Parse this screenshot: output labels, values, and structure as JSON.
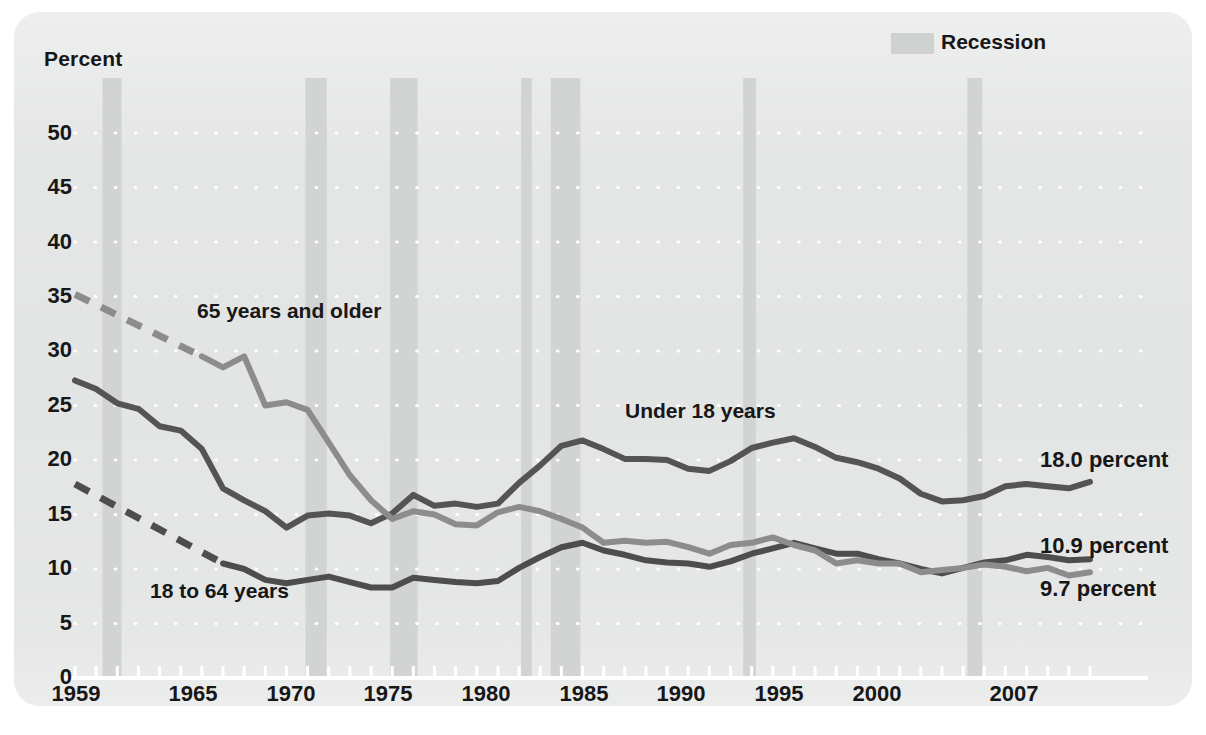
{
  "figure": {
    "panel_background": "#e3e4e4",
    "page_background": "#ffffff"
  },
  "legend": {
    "position": "top-right",
    "swatch_name": "recession-swatch",
    "label": "Recession",
    "swatch_color": "#cfd0d0"
  },
  "axes": {
    "y_title": "Percent",
    "y_ticks": [
      "0",
      "5",
      "10",
      "15",
      "20",
      "25",
      "30",
      "35",
      "40",
      "45",
      "50"
    ],
    "x_ticks": [
      "1959",
      "1965",
      "1970",
      "1975",
      "1980",
      "1985",
      "1990",
      "1995",
      "2000",
      "2007"
    ]
  },
  "series_labels": {
    "older": "65 years and older",
    "under18": "Under 18 years",
    "adults": "18 to 64 years"
  },
  "end_labels": {
    "under18": "18.0 percent",
    "older": "10.9 percent",
    "adults": "9.7 percent"
  },
  "chart_data": {
    "type": "line",
    "title": "",
    "subtitle": "",
    "xlabel": "",
    "ylabel": "Percent",
    "xlim": [
      1959,
      2007
    ],
    "ylim": [
      0,
      50
    ],
    "ytick_step": 5,
    "grid": "dotted-horizontal-white",
    "legend_position": "top-right",
    "colors": {
      "under18": "#545454",
      "adults": "#4d4d4d",
      "older": "#8c8c8c"
    },
    "annotations": [
      {
        "text": "65 years and older",
        "x": 1962.5,
        "y": 31.5
      },
      {
        "text": "Under 18 years",
        "x": 1984.0,
        "y": 25.6
      },
      {
        "text": "18 to 64 years",
        "x": 1963.0,
        "y": 7.4
      }
    ],
    "recession_bands": [
      {
        "start": 1960.3,
        "end": 1961.2
      },
      {
        "start": 1969.9,
        "end": 1970.9
      },
      {
        "start": 1973.9,
        "end": 1975.2
      },
      {
        "start": 1980.1,
        "end": 1980.6
      },
      {
        "start": 1981.5,
        "end": 1982.9
      },
      {
        "start": 1990.6,
        "end": 1991.2
      },
      {
        "start": 2001.2,
        "end": 2001.9
      }
    ],
    "x": [
      1959,
      1960,
      1961,
      1962,
      1963,
      1964,
      1965,
      1966,
      1967,
      1968,
      1969,
      1970,
      1971,
      1972,
      1973,
      1974,
      1975,
      1976,
      1977,
      1978,
      1979,
      1980,
      1981,
      1982,
      1983,
      1984,
      1985,
      1986,
      1987,
      1988,
      1989,
      1990,
      1991,
      1992,
      1993,
      1994,
      1995,
      1996,
      1997,
      1998,
      1999,
      2000,
      2001,
      2002,
      2003,
      2004,
      2005,
      2006,
      2007
    ],
    "series": [
      {
        "name": "Under 18 years",
        "dashed_prefix_through": 1959,
        "values": [
          27.3,
          26.5,
          25.2,
          24.7,
          23.1,
          22.7,
          21.0,
          17.4,
          16.3,
          15.3,
          13.8,
          14.9,
          15.1,
          14.9,
          14.2,
          15.1,
          16.8,
          15.8,
          16.0,
          15.7,
          16.0,
          17.9,
          19.5,
          21.3,
          21.8,
          21.0,
          20.1,
          20.1,
          20.0,
          19.2,
          19.0,
          19.9,
          21.1,
          21.6,
          22.0,
          21.2,
          20.2,
          19.8,
          19.2,
          18.3,
          16.9,
          16.2,
          16.3,
          16.7,
          17.6,
          17.8,
          17.6,
          17.4,
          18.0
        ],
        "end_value": 18.0
      },
      {
        "name": "18 to 64 years",
        "dashed_prefix_through": 1966,
        "dashed_from": 17.8,
        "values": [
          17.8,
          16.6,
          15.4,
          14.3,
          13.2,
          12.1,
          11.0,
          10.5,
          10.0,
          9.0,
          8.7,
          9.0,
          9.3,
          8.8,
          8.3,
          8.3,
          9.2,
          9.0,
          8.8,
          8.7,
          8.9,
          10.1,
          11.1,
          12.0,
          12.4,
          11.7,
          11.3,
          10.8,
          10.6,
          10.5,
          10.2,
          10.7,
          11.4,
          11.9,
          12.4,
          11.9,
          11.4,
          11.4,
          10.9,
          10.5,
          10.0,
          9.6,
          10.1,
          10.6,
          10.8,
          11.3,
          11.1,
          10.8,
          10.9
        ],
        "end_value": 10.9
      },
      {
        "name": "65 years and older",
        "dashed_prefix_through": 1965,
        "dashed_from": 35.2,
        "values": [
          35.2,
          34.0,
          32.9,
          31.8,
          30.6,
          29.5,
          29.5,
          28.5,
          29.5,
          25.0,
          25.3,
          24.6,
          21.6,
          18.6,
          16.3,
          14.6,
          15.3,
          15.0,
          14.1,
          14.0,
          15.2,
          15.7,
          15.3,
          14.6,
          13.8,
          12.4,
          12.6,
          12.4,
          12.5,
          12.0,
          11.4,
          12.2,
          12.4,
          12.9,
          12.2,
          11.7,
          10.5,
          10.8,
          10.5,
          10.5,
          9.7,
          9.9,
          10.1,
          10.4,
          10.2,
          9.8,
          10.1,
          9.4,
          9.7
        ],
        "end_value": 9.7
      }
    ]
  }
}
